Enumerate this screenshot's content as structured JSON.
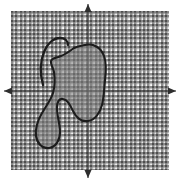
{
  "figure": {
    "title": "",
    "type": "coordinate-plane-with-shaded-region",
    "width": 182,
    "height": 185,
    "background_color": "#ffffff"
  },
  "plane": {
    "name": "graph-paper-plane",
    "left": 11,
    "top": 11,
    "width": 158,
    "height": 159,
    "grid_cell_px": 4.4,
    "grid_color": "#8d8d8d",
    "paper_color": "#ffffff"
  },
  "axes": {
    "origin_x": 88,
    "origin_y": 91,
    "x_axis": {
      "label": "",
      "from_x": 4,
      "to_x": 176,
      "y": 91,
      "arrow_left": true,
      "arrow_right": true,
      "color": "#3a3a3a"
    },
    "y_axis": {
      "label": "",
      "x": 88,
      "from_y": 4,
      "to_y": 178,
      "arrow_up": true,
      "arrow_down": true,
      "color": "#3a3a3a"
    },
    "tick_labels_x": [],
    "tick_labels_y": []
  },
  "region": {
    "name": "shaded-region",
    "fill_color": "#7f7f7f",
    "fill_opacity": 0.55,
    "outline_color": "#1c1c1c",
    "outline_width": 2.1,
    "body_path": "M 85,45 C 94,43 101,48 104,56 C 107,64 106,72 105,80 C 104,89 104,97 102,105 C 100,113 95,120 88,121 C 81,122 76,117 73,111 C 70,105 68,100 63,99 C 59,98 57,102 57,108 C 57,116 60,124 60,132 C 60,140 56,147 49,148 C 42,149 37,143 36,136 C 35,128 38,120 42,113 C 46,106 51,100 53,93 C 55,86 55,79 54,72 C 53,67 50,64 51,61 C 52,58 57,58 61,56 C 66,54 70,51 74,48 C 78,46 81,46 85,45 Z",
    "tail_path": "M 43,85 C 40,74 40,62 44,52 C 47,44 53,38 60,38 C 65,38 68,41 68,45"
  },
  "icons": {
    "arrow_up": "arrow-up-icon",
    "arrow_down": "arrow-down-icon",
    "arrow_left": "arrow-left-icon",
    "arrow_right": "arrow-right-icon"
  },
  "chart_data": {
    "type": "scatter",
    "title": "",
    "subtitle": "",
    "xlabel": "",
    "ylabel": "",
    "xlim": [
      -18,
      18
    ],
    "ylim": [
      -18,
      18
    ],
    "grid": true,
    "legend": null,
    "annotations": [],
    "shapes": [
      {
        "name": "shaded-region",
        "kind": "closed-blob",
        "shading": "gray-translucent",
        "quadrants_covered": [
          "II",
          "III",
          "I",
          "IV"
        ],
        "approx_extent_px": {
          "x_min": 35,
          "x_max": 107,
          "y_min": 43,
          "y_max": 150
        }
      },
      {
        "name": "open-curve-tail",
        "kind": "open-arc",
        "shading": "none",
        "approx_extent_px": {
          "x_min": 39,
          "x_max": 69,
          "y_min": 37,
          "y_max": 86
        }
      }
    ]
  }
}
